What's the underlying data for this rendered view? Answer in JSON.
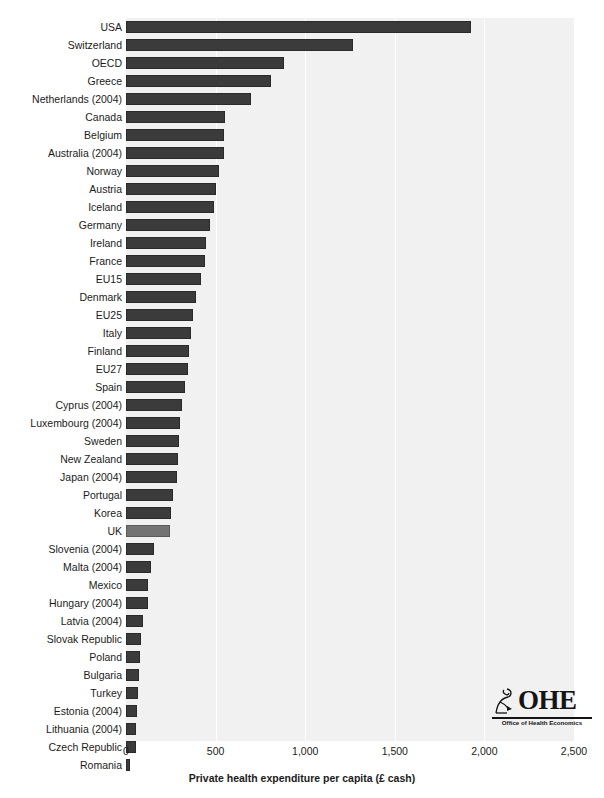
{
  "chart_data": {
    "type": "bar",
    "orientation": "horizontal",
    "title": "",
    "subtitle": "",
    "xlabel": "Private health expenditure per capita (£ cash)",
    "ylabel": "",
    "xlim": [
      0,
      2500
    ],
    "xticks": [
      0,
      500,
      1000,
      1500,
      2000,
      2500
    ],
    "xticklabels": [
      "0",
      "500",
      "1,000",
      "1,500",
      "2,000",
      "2,500"
    ],
    "grid": "vertical-white",
    "legend": "none",
    "highlight_category": "UK",
    "colors": {
      "bar": "#3b3b3b",
      "bar_highlight": "#737373",
      "plot_background": "#f1f1f1",
      "gridline": "#ffffff",
      "text": "#1b1b1b"
    },
    "categories": [
      "USA",
      "Switzerland",
      "OECD",
      "Greece",
      "Netherlands (2004)",
      "Canada",
      "Belgium",
      "Australia (2004)",
      "Norway",
      "Austria",
      "Iceland",
      "Germany",
      "Ireland",
      "France",
      "EU15",
      "Denmark",
      "EU25",
      "Italy",
      "Finland",
      "EU27",
      "Spain",
      "Cyprus (2004)",
      "Luxembourg (2004)",
      "Sweden",
      "New Zealand",
      "Japan (2004)",
      "Portugal",
      "Korea",
      "UK",
      "Slovenia (2004)",
      "Malta (2004)",
      "Mexico",
      "Hungary (2004)",
      "Latvia (2004)",
      "Slovak Republic",
      "Poland",
      "Bulgaria",
      "Turkey",
      "Estonia (2004)",
      "Lithuania (2004)",
      "Czech Republic",
      "Romania"
    ],
    "values": [
      1925,
      1265,
      880,
      810,
      695,
      550,
      548,
      545,
      520,
      505,
      490,
      470,
      445,
      440,
      420,
      390,
      375,
      360,
      350,
      345,
      330,
      310,
      300,
      295,
      290,
      285,
      265,
      250,
      245,
      155,
      140,
      125,
      120,
      95,
      85,
      80,
      70,
      65,
      60,
      58,
      55,
      25
    ]
  },
  "x_axis": {
    "title": "Private health expenditure per capita (£ cash)",
    "ticks": [
      "0",
      "500",
      "1,000",
      "1,500",
      "2,000",
      "2,500"
    ]
  },
  "logo": {
    "main": "OHE",
    "subtitle": "Office of Health Economics",
    "mark_name": "seated-figure-mark"
  }
}
